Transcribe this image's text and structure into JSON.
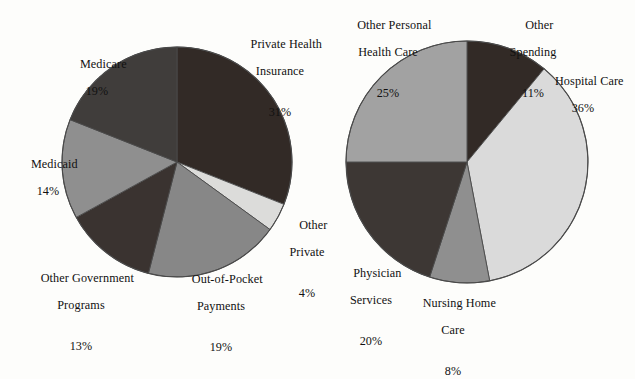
{
  "chart_data": [
    {
      "type": "pie",
      "title": "",
      "id": "sources-of-health-care-spending",
      "position": "left",
      "center": [
        177,
        162
      ],
      "radius": 115,
      "start_angle_deg": 0,
      "direction": "clockwise",
      "labels": [
        "Private Health Insurance",
        "Other Private",
        "Out-of-Pocket Payments",
        "Other Government Programs",
        "Medicaid",
        "Medicare"
      ],
      "values": [
        31,
        4,
        19,
        13,
        14,
        19
      ],
      "value_suffix": "%",
      "colors": [
        "#322a26",
        "#dcdcda",
        "#878787",
        "#3a3330",
        "#8f8f8f",
        "#403d3b"
      ],
      "slices": [
        {
          "label": "Private Health Insurance",
          "value": 31,
          "pct_text": "31%",
          "color": "#322a26",
          "label_lines": [
            "Private Health",
            "Insurance"
          ]
        },
        {
          "label": "Other Private",
          "value": 4,
          "pct_text": "4%",
          "color": "#dcdcda",
          "label_lines": [
            "Other",
            "Private"
          ]
        },
        {
          "label": "Out-of-Pocket Payments",
          "value": 19,
          "pct_text": "19%",
          "color": "#878787",
          "label_lines": [
            "Out-of-Pocket",
            "Payments"
          ]
        },
        {
          "label": "Other Government Programs",
          "value": 13,
          "pct_text": "13%",
          "color": "#3a3330",
          "label_lines": [
            "Other Government",
            "Programs"
          ]
        },
        {
          "label": "Medicaid",
          "value": 14,
          "pct_text": "14%",
          "color": "#8f8f8f",
          "label_lines": [
            "Medicaid"
          ]
        },
        {
          "label": "Medicare",
          "value": 19,
          "pct_text": "19%",
          "color": "#403d3b",
          "label_lines": [
            "Medicare"
          ]
        }
      ]
    },
    {
      "type": "pie",
      "title": "",
      "id": "uses-of-health-care-spending",
      "position": "right",
      "center": [
        467,
        162
      ],
      "radius": 121,
      "start_angle_deg": 0,
      "direction": "clockwise",
      "labels": [
        "Other Spending",
        "Hospital Care",
        "Nursing Home Care",
        "Physician Services",
        "Other Personal Health Care"
      ],
      "values": [
        11,
        36,
        8,
        20,
        25
      ],
      "value_suffix": "%",
      "colors": [
        "#322a26",
        "#dadada",
        "#8f8f8f",
        "#3d3734",
        "#a2a2a2"
      ],
      "slices": [
        {
          "label": "Other Spending",
          "value": 11,
          "pct_text": "11%",
          "color": "#322a26",
          "label_lines": [
            "Other",
            "Spending"
          ]
        },
        {
          "label": "Hospital Care",
          "value": 36,
          "pct_text": "36%",
          "color": "#dadada",
          "label_lines": [
            "Hospital Care"
          ]
        },
        {
          "label": "Nursing Home Care",
          "value": 8,
          "pct_text": "8%",
          "color": "#8f8f8f",
          "label_lines": [
            "Nursing Home",
            "Care"
          ]
        },
        {
          "label": "Physician Services",
          "value": 20,
          "pct_text": "20%",
          "color": "#3d3734",
          "label_lines": [
            "Physician",
            "Services"
          ]
        },
        {
          "label": "Other Personal Health Care",
          "value": 25,
          "pct_text": "25%",
          "color": "#a2a2a2",
          "label_lines": [
            "Other Personal",
            "Health Care"
          ]
        }
      ]
    }
  ],
  "left_chart": {
    "medicare": {
      "line1": "Medicare",
      "pct": "19%"
    },
    "medicaid": {
      "line1": "Medicaid",
      "pct": "14%"
    },
    "other_government": {
      "line1": "Other Government",
      "line2": "Programs",
      "pct": "13%"
    },
    "out_of_pocket": {
      "line1": "Out-of-Pocket",
      "line2": "Payments",
      "pct": "19%"
    },
    "other_private": {
      "line1": "Other",
      "line2": "Private",
      "pct": "4%"
    },
    "private_health_insurance": {
      "line1": "Private Health",
      "line2": "Insurance",
      "pct": "31%"
    }
  },
  "right_chart": {
    "other_spending": {
      "line1": "Other",
      "line2": "Spending",
      "pct": "11%"
    },
    "hospital_care": {
      "line1": "Hospital Care",
      "pct": "36%"
    },
    "nursing_home_care": {
      "line1": "Nursing Home",
      "line2": "Care",
      "pct": "8%"
    },
    "physician_services": {
      "line1": "Physician",
      "line2": "Services",
      "pct": "20%"
    },
    "other_personal_health_care": {
      "line1": "Other Personal",
      "line2": "Health Care",
      "pct": "25%"
    }
  },
  "style": {
    "background": "#fdfdfb",
    "outline": "#4a4a4a",
    "text": "#111111"
  }
}
